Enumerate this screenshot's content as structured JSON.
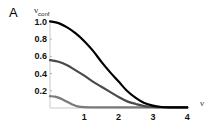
{
  "panel_label": "A",
  "chart_data": {
    "type": "line",
    "title": "",
    "xlabel": "ν",
    "ylabel": "ν_conf",
    "ylabel_main": "ν",
    "ylabel_sub": "conf",
    "xlim": [
      0,
      4
    ],
    "ylim": [
      0,
      1.0
    ],
    "xticks": [
      1,
      2,
      3,
      4
    ],
    "yticks": [
      0.2,
      0.4,
      0.6,
      0.8,
      1.0
    ],
    "xtick_labels": [
      "1",
      "2",
      "3",
      "4"
    ],
    "ytick_labels": [
      "0.2",
      "0.4",
      "0.6",
      "0.8",
      "1.0"
    ],
    "grid": false,
    "legend": null,
    "series": [
      {
        "name": "curve-1",
        "color": "#000000",
        "x": [
          0,
          0.25,
          0.5,
          0.75,
          1.0,
          1.25,
          1.5,
          1.75,
          2.0,
          2.25,
          2.5,
          2.75,
          3.0,
          3.25,
          3.5,
          4.0
        ],
        "values": [
          1.0,
          0.98,
          0.93,
          0.86,
          0.77,
          0.66,
          0.53,
          0.41,
          0.3,
          0.19,
          0.11,
          0.05,
          0.02,
          0.005,
          0.0,
          0.0
        ]
      },
      {
        "name": "curve-2",
        "color": "#4a4a4a",
        "x": [
          0,
          0.25,
          0.5,
          0.75,
          1.0,
          1.25,
          1.5,
          1.75,
          2.0,
          2.25,
          2.5,
          2.75,
          3.0,
          3.5,
          4.0
        ],
        "values": [
          0.55,
          0.53,
          0.49,
          0.43,
          0.37,
          0.3,
          0.24,
          0.18,
          0.12,
          0.07,
          0.04,
          0.015,
          0.005,
          0.0,
          0.0
        ]
      },
      {
        "name": "curve-3",
        "color": "#7a7a7a",
        "x": [
          0,
          0.15,
          0.3,
          0.5,
          0.65,
          0.8,
          1.0,
          1.5,
          2.0,
          3.0,
          4.0
        ],
        "values": [
          0.13,
          0.125,
          0.105,
          0.065,
          0.035,
          0.012,
          0.003,
          0.0,
          0.0,
          0.0,
          0.0
        ]
      }
    ]
  }
}
